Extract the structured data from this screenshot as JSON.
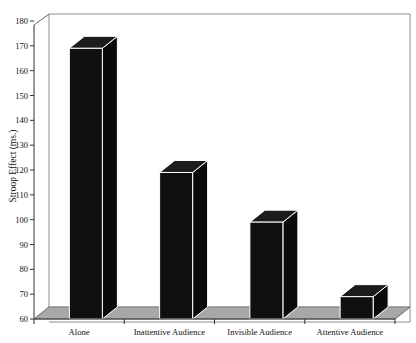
{
  "chart_data": {
    "type": "bar",
    "title": "",
    "subtitle": "",
    "xlabel": "",
    "ylabel": "Stroop Effect (ms.)",
    "categories": [
      "Alone",
      "Inattentive Audience",
      "Invisible Audience",
      "Attentive Audience"
    ],
    "values": [
      169,
      119,
      99,
      69
    ],
    "ylim": [
      60,
      180
    ],
    "ytick_step": 10,
    "yticks": [
      60,
      70,
      80,
      90,
      100,
      110,
      120,
      130,
      140,
      150,
      160,
      170,
      180
    ],
    "ytick_labels": [
      "60",
      "70",
      "80",
      "90",
      "100",
      "110",
      "120",
      "130",
      "140",
      "150",
      "160",
      "170",
      "180"
    ],
    "grid": false,
    "legend": null,
    "legend_position": "none",
    "style": "3d-column",
    "annotations": [],
    "colors": {
      "bar_front": "#101010",
      "bar_top": "#1c1c1c",
      "bar_side": "#0a0a0a",
      "bar_edge": "#ffffff",
      "floor": "#a8a8a8",
      "floor_edge": "#6e6e6e",
      "axis": "#333333",
      "frame": "#8c8c8c",
      "background": "#ffffff",
      "text": "#111111"
    }
  }
}
